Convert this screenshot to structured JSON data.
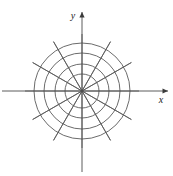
{
  "figure": {
    "name": "polar-coordinate-grid",
    "background_color": "#ffffff",
    "width": 173,
    "height": 176,
    "line_color": "#5a5a5a",
    "axis_color": "#4a4a4a",
    "label_color": "#1a1a1a"
  },
  "axes": {
    "origin": {
      "x": 82,
      "y": 91
    },
    "x_axis": {
      "label": "x",
      "start_x": 2,
      "end_x": 168,
      "y": 91,
      "arrow": "right-arrow",
      "label_x": 161,
      "label_y": 103
    },
    "y_axis": {
      "label": "y",
      "x": 82,
      "start_y": 172,
      "end_y": 12,
      "arrow": "up-arrow",
      "label_x": 73,
      "label_y": 19
    }
  },
  "chart_data": {
    "type": "polar-grid",
    "title": "",
    "center": {
      "x": 82,
      "y": 91
    },
    "circle_count": 4,
    "circle_radii": [
      17,
      27,
      38,
      48
    ],
    "spoke_count": 12,
    "spoke_angle_step_degrees": 30,
    "spoke_angles_degrees": [
      0,
      30,
      60,
      90,
      120,
      150,
      180,
      210,
      240,
      270,
      300,
      330
    ],
    "spoke_radius": 57,
    "grid": true,
    "legend": "none",
    "xlabel": "x",
    "ylabel": "y"
  }
}
